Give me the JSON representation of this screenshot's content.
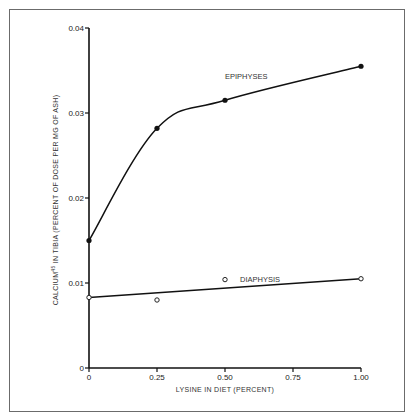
{
  "chart_data": {
    "type": "line",
    "title": "",
    "xlabel": "LYSINE IN DIET (PERCENT)",
    "ylabel": "CALCIUM45 IN TIBIA (PERCENT OF DOSE PER MG OF ASH)",
    "ylabel_parts": {
      "pre": "CALCIUM",
      "sup": "45",
      "post": " IN TIBIA (PERCENT OF DOSE PER MG OF ASH)"
    },
    "xlim": [
      0,
      1.0
    ],
    "ylim": [
      0,
      0.04
    ],
    "x_ticks": [
      0,
      0.25,
      0.5,
      0.75,
      1.0
    ],
    "x_tick_labels": [
      "0",
      "0.25",
      "0.50",
      "0.75",
      "1.00"
    ],
    "y_ticks": [
      0,
      0.01,
      0.02,
      0.03,
      0.04
    ],
    "y_tick_labels": [
      "0",
      "0.01",
      "0.02",
      "0.03",
      "0.04"
    ],
    "grid": false,
    "legend": "inline labels",
    "series": [
      {
        "name": "EPIPHYSES",
        "marker": "filled-circle",
        "fit": "smooth curve",
        "x": [
          0,
          0.25,
          0.5,
          1.0
        ],
        "values": [
          0.015,
          0.0282,
          0.0315,
          0.0355
        ]
      },
      {
        "name": "DIAPHYSIS",
        "marker": "open-circle",
        "fit": "straight line",
        "x": [
          0,
          0.25,
          0.5,
          1.0
        ],
        "values": [
          0.0083,
          0.008,
          0.0104,
          0.0105
        ],
        "fit_line": {
          "from": [
            0,
            0.0083
          ],
          "to": [
            1.0,
            0.0105
          ]
        }
      }
    ]
  }
}
